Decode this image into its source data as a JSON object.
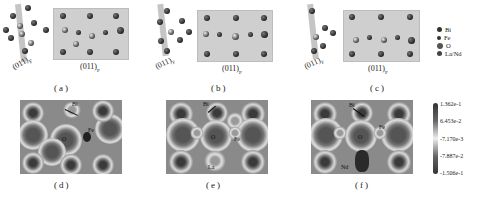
{
  "figure": {
    "top_row": [
      {
        "panel": "(a)",
        "side_label": "(011)",
        "side_sub": "F",
        "plane_label": "(011)",
        "plane_sub": "P"
      },
      {
        "panel": "(b)",
        "side_label": "(011)",
        "side_sub": "F",
        "plane_label": "(011)",
        "plane_sub": "P"
      },
      {
        "panel": "(c)",
        "side_label": "(011)",
        "side_sub": "F",
        "plane_label": "(011)",
        "plane_sub": "P"
      }
    ],
    "legend": [
      {
        "label": "Bi",
        "color": "#333333"
      },
      {
        "label": "Fe",
        "color": "#222222"
      },
      {
        "label": "O",
        "color": "#555555"
      },
      {
        "label": "La/Nd",
        "color": "#444444"
      }
    ],
    "bottom_row": [
      {
        "panel": "(d)",
        "annotations": [
          "Bi",
          "Fe",
          "O"
        ]
      },
      {
        "panel": "(e)",
        "annotations": [
          "Bi",
          "O",
          "Fe",
          "La"
        ]
      },
      {
        "panel": "(f)",
        "annotations": [
          "Bi",
          "Fe",
          "O",
          "Nd"
        ]
      }
    ],
    "colorbar": {
      "ticks": [
        "1.362e-1",
        "6.453e-2",
        "-7.170e-3",
        "-7.887e-2",
        "-1.506e-1"
      ],
      "colors": {
        "high": "#333333",
        "mid": "#eeeeee",
        "low": "#333333"
      }
    }
  }
}
